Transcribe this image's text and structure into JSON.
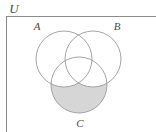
{
  "figure": {
    "type": "venn-diagram",
    "set_count": 3,
    "background_color": "#ffffff",
    "stroke_color": "#9a9a9a",
    "rectangle_stroke_color": "#8c8c8c",
    "shade_color": "#d6d6d6",
    "label_color": "#4a4a4a"
  },
  "labels": {
    "universe": "U",
    "set_a": "A",
    "set_b": "B",
    "set_c": "C"
  },
  "geometry": {
    "rectangle": {
      "x": 6,
      "y": 16,
      "width": 150,
      "height": 116
    },
    "circles": [
      {
        "id": "A",
        "cx": 64,
        "cy": 59,
        "r": 28
      },
      {
        "id": "B",
        "cx": 93,
        "cy": 59,
        "r": 28
      },
      {
        "id": "C",
        "cx": 79,
        "cy": 85,
        "r": 28
      }
    ],
    "label_positions": {
      "universe": {
        "x": 14,
        "y": 13
      },
      "set_a": {
        "x": 34,
        "y": 29
      },
      "set_b": {
        "x": 113,
        "y": 29
      },
      "set_c": {
        "x": 76,
        "y": 127
      }
    },
    "shaded_region": "C \\ (A ∪ B)"
  }
}
